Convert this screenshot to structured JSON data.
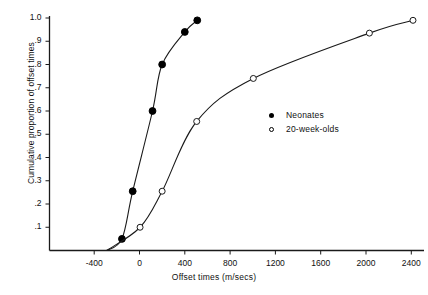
{
  "chart_data": {
    "type": "line",
    "title": "",
    "xlabel": "Offset times (m/secs)",
    "ylabel": "Cumulative proportion of offset times",
    "xlim": [
      -700,
      2520
    ],
    "ylim": [
      0.0,
      1.0
    ],
    "xticks": [
      -400,
      0,
      400,
      800,
      1200,
      1600,
      2000,
      2400
    ],
    "xtick_labels": [
      "-400",
      "0",
      "400",
      "800",
      "1200",
      "1600",
      "2000",
      "2400"
    ],
    "yticks": [
      0.1,
      0.2,
      0.3,
      0.4,
      0.5,
      0.6,
      0.7,
      0.8,
      0.9,
      1.0
    ],
    "ytick_labels": [
      ".1",
      ".2",
      ".3",
      ".4",
      ".5",
      ".6",
      ".7",
      ".8",
      ".9",
      "1.0"
    ],
    "grid": false,
    "legend_position": "center-right",
    "series": [
      {
        "name": "Neonates",
        "marker": "filled-circle",
        "x": [
          -155,
          -60,
          115,
          200,
          400,
          510
        ],
        "y": [
          0.05,
          0.255,
          0.6,
          0.8,
          0.94,
          0.99
        ]
      },
      {
        "name": "20-week-olds",
        "marker": "open-circle",
        "x": [
          5,
          200,
          505,
          1005,
          2030,
          2415
        ],
        "y": [
          0.1,
          0.255,
          0.555,
          0.74,
          0.935,
          0.99
        ]
      }
    ],
    "curve_origin": {
      "x": -290,
      "y": 0.0
    }
  },
  "legend": {
    "items": [
      {
        "label": "Neonates",
        "marker": "filled-circle"
      },
      {
        "label": "20-week-olds",
        "marker": "open-circle"
      }
    ]
  },
  "artifact": {
    "corner_text": ""
  },
  "colors": {
    "axis": "#1a1a1a",
    "line": "#1a1a1a",
    "marker_fill": "#000000",
    "marker_open_fill": "#ffffff",
    "background": "#ffffff"
  }
}
